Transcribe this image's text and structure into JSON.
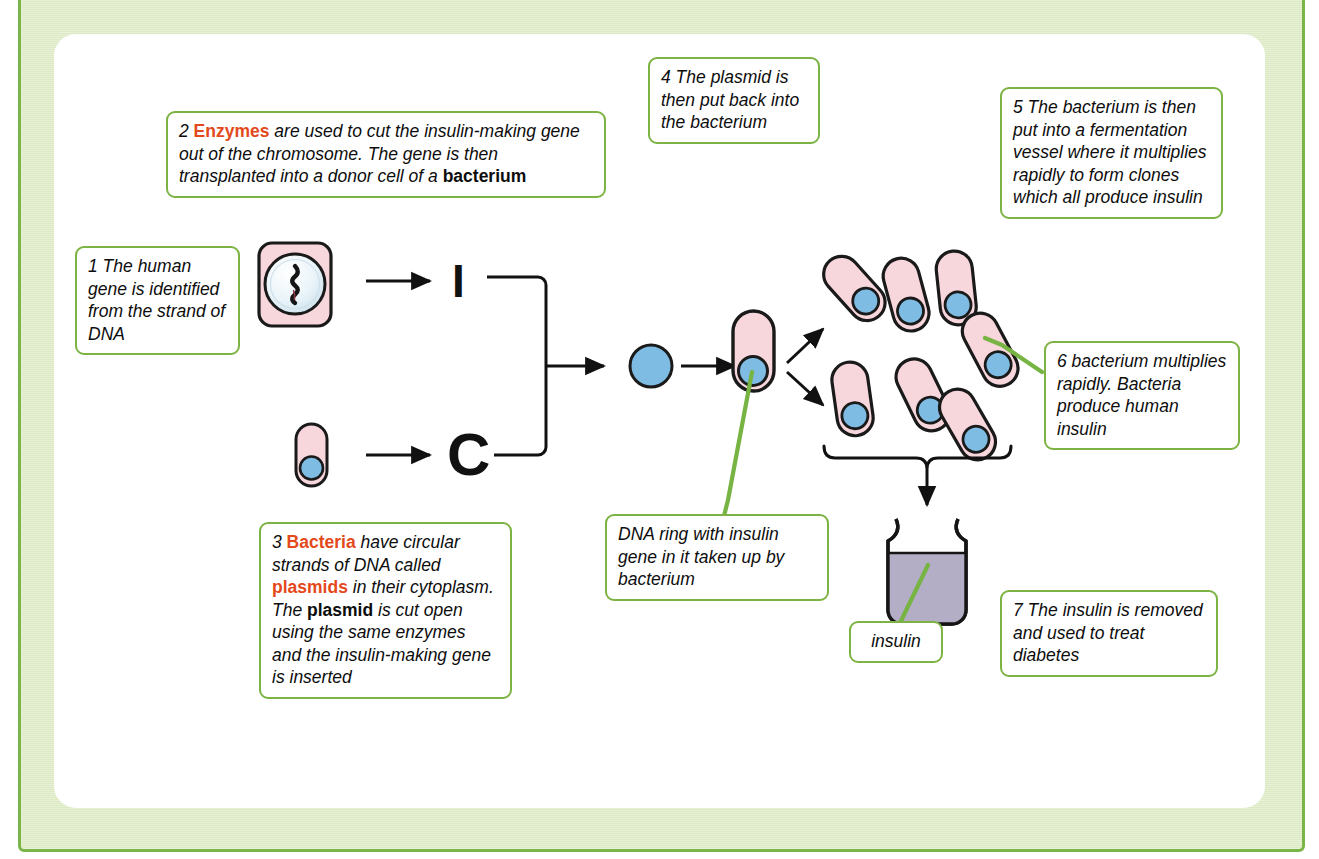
{
  "diagram": {
    "frame_color": "#7ab547",
    "panel_fill": "#dceac3",
    "card_fill": "#ffffff",
    "box_border_color": "#7cb342",
    "highlight_color": "#e4491c",
    "cell_fill": "#f7d6dc",
    "plasmid_fill": "#7fbce4",
    "nucleus_fill": "#e8f3f8",
    "vessel_fill": "#b3aec6"
  },
  "steps": {
    "step1": {
      "number": "1",
      "text": "The human gene is identified from the strand of DNA"
    },
    "step2": {
      "number": "2",
      "lead_bold": "Enzymes",
      "text_mid": " are used to cut the insulin-making gene out of the chromosome. The gene is then transplanted into a donor cell of a ",
      "tail_bold": "bacterium"
    },
    "step3": {
      "number": "3",
      "bold1": "Bacteria",
      "part1": " have circular strands of DNA called ",
      "bold2": "plasmids",
      "part2": " in their cytoplasm. The ",
      "bold3": "plasmid",
      "part3": " is cut open using the same enzymes and the insulin-making gene is inserted"
    },
    "step4": {
      "number": "4",
      "text": "The plasmid is then put back into the bacterium"
    },
    "step5": {
      "number": "5",
      "text": "The bacterium is then put into a fermentation vessel where it multiplies rapidly to form clones which all produce insulin"
    },
    "step6": {
      "number": "6",
      "text": "bacterium multiplies rapidly. Bacteria produce human insulin"
    },
    "step7": {
      "number": "7",
      "text": "The insulin is removed and used to treat diabetes"
    }
  },
  "labels": {
    "dna_ring": "DNA ring with insulin gene in it taken up by bacterium",
    "insulin": "insulin",
    "gene_symbol": "I",
    "plasmid_symbol": "C"
  },
  "artwork": {
    "human_cell_name": "human cell with nucleus and chromosome",
    "bacterium_name": "bacterium with plasmid",
    "recombinant_plasmid_name": "recombinant plasmid ring",
    "clone_count": 7,
    "vessel_name": "fermentation vessel"
  }
}
